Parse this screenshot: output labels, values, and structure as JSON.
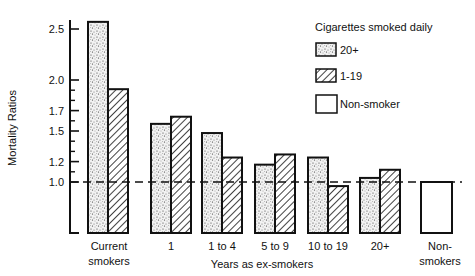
{
  "chart_data": {
    "type": "bar",
    "title": "",
    "xlabel": "Years as ex-smokers",
    "ylabel": "Mortality Ratios",
    "ylim": [
      0.5,
      2.6
    ],
    "y_ticks_labeled": [
      1.0,
      1.2,
      1.5,
      1.7,
      2.0,
      2.5
    ],
    "y_ticks_minor": [
      1.1,
      1.3,
      1.4,
      1.6,
      1.8,
      1.9
    ],
    "reference_line": {
      "value": 1.0,
      "style": "dashed"
    },
    "categories": [
      "Current smokers",
      "1",
      "1 to 4",
      "5 to 9",
      "10 to 19",
      "20+",
      "Non-smokers"
    ],
    "category_labels": [
      [
        "Current",
        "smokers"
      ],
      [
        "1"
      ],
      [
        "1 to 4"
      ],
      [
        "5 to 9"
      ],
      [
        "10 to 19"
      ],
      [
        "20+"
      ],
      [
        "Non-",
        "smokers"
      ]
    ],
    "legend": {
      "title": "Cigarettes smoked daily",
      "position": "upper right",
      "entries": [
        {
          "label": "20+",
          "pattern": "stipple"
        },
        {
          "label": "1-19",
          "pattern": "hatch"
        },
        {
          "label": "Non-smoker",
          "pattern": "empty"
        }
      ]
    },
    "series": [
      {
        "name": "20+",
        "pattern": "stipple",
        "values": [
          2.57,
          1.57,
          1.48,
          1.17,
          1.24,
          1.04,
          null
        ]
      },
      {
        "name": "1-19",
        "pattern": "hatch",
        "values": [
          1.91,
          1.64,
          1.24,
          1.27,
          0.96,
          1.12,
          null
        ]
      },
      {
        "name": "Non-smoker",
        "pattern": "empty",
        "values": [
          null,
          null,
          null,
          null,
          null,
          null,
          1.0
        ]
      }
    ],
    "grid": false
  }
}
